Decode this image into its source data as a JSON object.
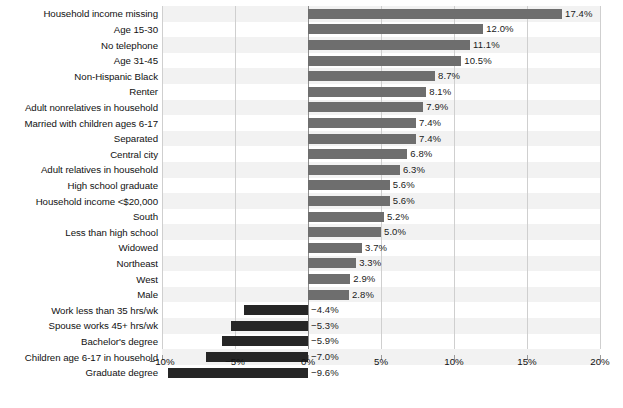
{
  "chart_data": {
    "type": "bar",
    "orientation": "horizontal",
    "title": "",
    "xlabel": "",
    "ylabel": "",
    "xlim": [
      -10,
      20
    ],
    "xticks": [
      -10,
      -5,
      0,
      5,
      10,
      15,
      20
    ],
    "xtick_labels": [
      "−10%",
      "−5%",
      "0%",
      "5%",
      "10%",
      "15%",
      "20%"
    ],
    "grid": true,
    "legend": "none",
    "value_suffix": "%",
    "categories": [
      "Household income missing",
      "Age 15-30",
      "No telephone",
      "Age 31-45",
      "Non-Hispanic Black",
      "Renter",
      "Adult nonrelatives in household",
      "Married with children ages 6-17",
      "Separated",
      "Central city",
      "Adult relatives in household",
      "High school graduate",
      "Household income <$20,000",
      "South",
      "Less than high school",
      "Widowed",
      "Northeast",
      "West",
      "Male",
      "Work less than 35 hrs/wk",
      "Spouse works 45+ hrs/wk",
      "Bachelor's degree",
      "Children age 6-17 in household",
      "Graduate degree"
    ],
    "values": [
      17.4,
      12.0,
      11.1,
      10.5,
      8.7,
      8.1,
      7.9,
      7.4,
      7.4,
      6.8,
      6.3,
      5.6,
      5.6,
      5.2,
      5.0,
      3.7,
      3.3,
      2.9,
      2.8,
      -4.4,
      -5.3,
      -5.9,
      -7.0,
      -9.6
    ],
    "value_labels": [
      "17.4%",
      "12.0%",
      "11.1%",
      "10.5%",
      "8.7%",
      "8.1%",
      "7.9%",
      "7.4%",
      "7.4%",
      "6.8%",
      "6.3%",
      "5.6%",
      "5.6%",
      "5.2%",
      "5.0%",
      "3.7%",
      "3.3%",
      "2.9%",
      "2.8%",
      "−4.4%",
      "−5.3%",
      "−5.9%",
      "−7.0%",
      "−9.6%"
    ],
    "colors": {
      "positive_bar": "#6e6e6e",
      "negative_bar": "#262626",
      "band_even": "#f2f2f2",
      "band_odd": "#ffffff",
      "gridline": "#cfcfcf",
      "zero_line": "#8c8c8c",
      "text": "#111111"
    }
  }
}
